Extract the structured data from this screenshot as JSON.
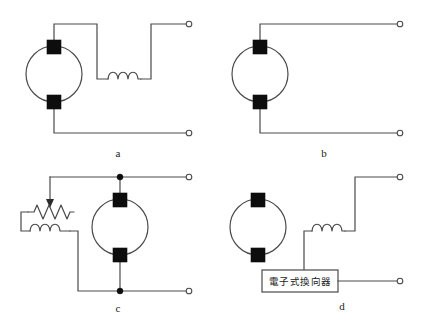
{
  "figure": {
    "type": "electrical-schematic-set",
    "background_color": "#ffffff",
    "line_color": "#4a4a4a",
    "brush_color": "#0d0d0d",
    "panel_count": 4
  },
  "panels": [
    {
      "id": "a",
      "caption": "a",
      "description": "DC machine with series field winding and two open terminals",
      "components": [
        "armature-circle",
        "brush-top",
        "brush-bottom",
        "series-field-coil",
        "terminal-top",
        "terminal-bottom"
      ]
    },
    {
      "id": "b",
      "caption": "b",
      "description": "DC machine with two open terminals, no field winding shown",
      "components": [
        "armature-circle",
        "brush-top",
        "brush-bottom",
        "terminal-top",
        "terminal-bottom"
      ]
    },
    {
      "id": "c",
      "caption": "c",
      "description": "DC machine with shunt field winding and adjustable rheostat",
      "components": [
        "armature-circle",
        "brush-top",
        "brush-bottom",
        "rheostat",
        "shunt-field-coil",
        "junction-top",
        "junction-bottom",
        "terminal-top",
        "terminal-bottom"
      ]
    },
    {
      "id": "d",
      "caption": "d",
      "description": "Brushless machine with field coil and electronic commutator block",
      "components": [
        "armature-circle",
        "brush-top",
        "brush-bottom",
        "field-coil",
        "electronic-commutator-box",
        "terminal-top",
        "terminal-bottom"
      ]
    }
  ],
  "labels": {
    "panel_a": "a",
    "panel_b": "b",
    "panel_c": "c",
    "panel_d": "d",
    "electronic_commutator": "電子式換向器"
  },
  "icons": {
    "coil": "inductor-coil-icon",
    "resistor": "zigzag-resistor-icon",
    "arrow": "down-arrow-icon",
    "terminal": "open-terminal-icon",
    "junction": "junction-dot-icon"
  }
}
